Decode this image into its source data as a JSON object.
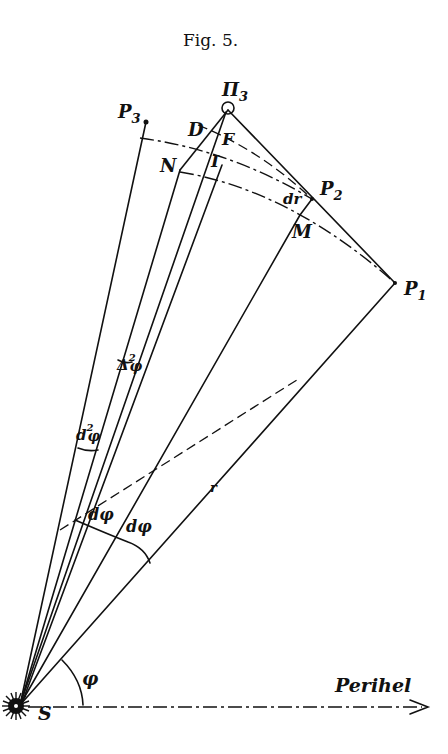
{
  "figure": {
    "caption": "Fig. 5.",
    "points": {
      "S": "S",
      "P1": "P",
      "P1_sub": "1",
      "P2": "P",
      "P2_sub": "2",
      "P3": "P",
      "P3_sub": "3",
      "Pi3": "Π",
      "Pi3_sub": "3",
      "D": "D",
      "F": "F",
      "I": "I",
      "N": "N",
      "M": "M"
    },
    "labels": {
      "dr": "dr",
      "r": "r",
      "dphi_1": "dφ",
      "dphi_2": "dφ",
      "d2phi": "d",
      "d2phi_exp": "2",
      "d2phi_var": "φ",
      "Delta2phi": "Δ",
      "Delta2phi_exp": "2",
      "Delta2phi_var": "φ",
      "phi": "φ",
      "axis": "Perihel"
    }
  }
}
